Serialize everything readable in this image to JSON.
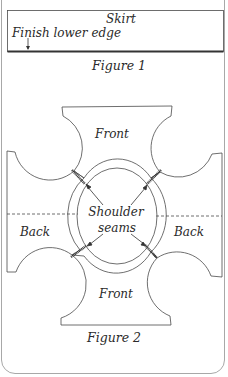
{
  "figure1": {
    "piece_label": "Skirt",
    "annotation": "Finish lower edge",
    "caption": "Figure 1"
  },
  "figure2": {
    "front_top_label": "Front",
    "front_bottom_label": "Front",
    "back_left_label": "Back",
    "back_right_label": "Back",
    "neck_label_line1": "Shoulder",
    "neck_label_line2": "seams",
    "caption": "Figure 2"
  },
  "colors": {
    "line": "#4a4a4a",
    "text": "#2a2a2a",
    "border": "#a8a8a8"
  }
}
